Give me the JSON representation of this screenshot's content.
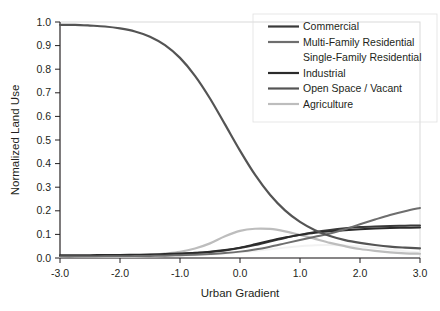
{
  "chart_data": {
    "type": "line",
    "title": "",
    "xlabel": "Urban Gradient",
    "ylabel": "Normalized Land Use",
    "xlim": [
      -3.0,
      3.0
    ],
    "ylim": [
      0.0,
      1.0
    ],
    "grid": false,
    "legend_position": "top-right",
    "xticks": [
      "-3.0",
      "-2.0",
      "-1.0",
      "0.0",
      "1.0",
      "2.0",
      "3.0"
    ],
    "xtick_values": [
      -3.0,
      -2.0,
      -1.0,
      0.0,
      1.0,
      2.0,
      3.0
    ],
    "yticks": [
      "0.0",
      "0.1",
      "0.2",
      "0.3",
      "0.4",
      "0.5",
      "0.6",
      "0.7",
      "0.8",
      "0.9",
      "1.0"
    ],
    "ytick_values": [
      0.0,
      0.1,
      0.2,
      0.3,
      0.4,
      0.5,
      0.6,
      0.7,
      0.8,
      0.9,
      1.0
    ],
    "x": [
      -3.0,
      -2.75,
      -2.5,
      -2.25,
      -2.0,
      -1.75,
      -1.5,
      -1.25,
      -1.0,
      -0.75,
      -0.5,
      -0.25,
      0.0,
      0.25,
      0.5,
      0.75,
      1.0,
      1.25,
      1.5,
      1.75,
      2.0,
      2.25,
      2.5,
      2.75,
      3.0
    ],
    "series": [
      {
        "name": "Commercial",
        "color": "#3a3a3a",
        "width": 2.0,
        "values": [
          0.008,
          0.008,
          0.009,
          0.009,
          0.01,
          0.011,
          0.012,
          0.014,
          0.016,
          0.02,
          0.025,
          0.032,
          0.042,
          0.055,
          0.07,
          0.085,
          0.098,
          0.11,
          0.119,
          0.126,
          0.131,
          0.134,
          0.136,
          0.137,
          0.138
        ]
      },
      {
        "name": "Multi-Family Residential",
        "color": "#6e6e6e",
        "width": 2.0,
        "values": [
          0.006,
          0.006,
          0.006,
          0.007,
          0.007,
          0.008,
          0.009,
          0.01,
          0.012,
          0.014,
          0.017,
          0.021,
          0.027,
          0.036,
          0.048,
          0.062,
          0.076,
          0.09,
          0.104,
          0.122,
          0.143,
          0.163,
          0.182,
          0.198,
          0.212
        ]
      },
      {
        "name": "Single-Family Residential",
        "color": "#f2f2f2",
        "width": 2.0,
        "values": [
          0.004,
          0.004,
          0.004,
          0.005,
          0.005,
          0.006,
          0.007,
          0.008,
          0.01,
          0.012,
          0.015,
          0.019,
          0.024,
          0.03,
          0.037,
          0.044,
          0.05,
          0.054,
          0.055,
          0.053,
          0.049,
          0.043,
          0.036,
          0.029,
          0.023
        ]
      },
      {
        "name": "Industrial",
        "color": "#2b2b2b",
        "width": 2.0,
        "values": [
          0.012,
          0.012,
          0.012,
          0.013,
          0.013,
          0.014,
          0.015,
          0.017,
          0.019,
          0.022,
          0.027,
          0.034,
          0.044,
          0.058,
          0.073,
          0.087,
          0.098,
          0.107,
          0.113,
          0.118,
          0.122,
          0.125,
          0.127,
          0.128,
          0.129
        ]
      },
      {
        "name": "Open Space / Vacant",
        "color": "#545454",
        "width": 2.2,
        "values": [
          0.988,
          0.988,
          0.985,
          0.981,
          0.973,
          0.96,
          0.938,
          0.902,
          0.848,
          0.772,
          0.676,
          0.566,
          0.455,
          0.353,
          0.268,
          0.202,
          0.153,
          0.118,
          0.093,
          0.076,
          0.064,
          0.055,
          0.048,
          0.044,
          0.041
        ]
      },
      {
        "name": "Agriculture",
        "color": "#bdbdbd",
        "width": 2.2,
        "values": [
          0.006,
          0.006,
          0.007,
          0.008,
          0.009,
          0.011,
          0.014,
          0.019,
          0.026,
          0.04,
          0.062,
          0.092,
          0.115,
          0.124,
          0.123,
          0.113,
          0.098,
          0.081,
          0.064,
          0.05,
          0.038,
          0.03,
          0.024,
          0.02,
          0.018
        ]
      }
    ],
    "legend_entries": [
      {
        "label": "Commercial",
        "color": "#3a3a3a",
        "swatch": true
      },
      {
        "label": "Multi-Family Residential",
        "color": "#6e6e6e",
        "swatch": true
      },
      {
        "label": "Single-Family Residential",
        "color": "#f2f2f2",
        "swatch": false
      },
      {
        "label": "Industrial",
        "color": "#2b2b2b",
        "swatch": true
      },
      {
        "label": "Open Space / Vacant",
        "color": "#545454",
        "swatch": true
      },
      {
        "label": "Agriculture",
        "color": "#bdbdbd",
        "swatch": true
      }
    ]
  }
}
